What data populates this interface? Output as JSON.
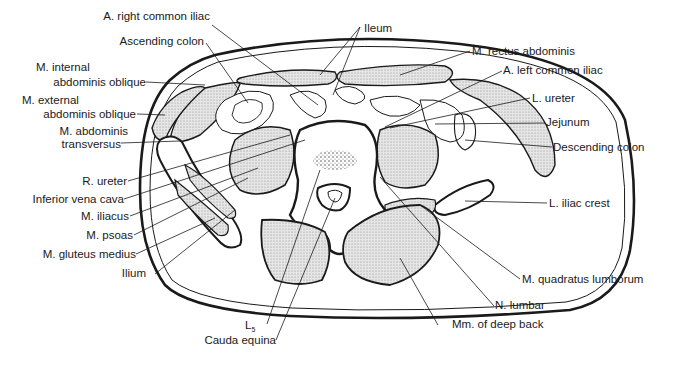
{
  "diagram": {
    "labels": {
      "a_right_common_iliac": "A. right common iliac",
      "ascending_colon": "Ascending colon",
      "m_internal_line1": "M. internal",
      "m_internal_line2": "abdominis oblique",
      "m_external_line1": "M. external",
      "m_external_line2": "abdominis oblique",
      "m_transversus_line1": "M. abdominis",
      "m_transversus_line2": "transversus",
      "r_ureter": "R. ureter",
      "inferior_vena_cava": "Inferior vena cava",
      "m_iliacus": "M. iliacus",
      "m_psoas": "M. psoas",
      "m_gluteus_medius": "M. gluteus medius",
      "ilium": "Ilium",
      "l5": "L",
      "l5_sub": "5",
      "cauda_equina": "Cauda equina",
      "ileum": "Ileum",
      "m_rectus_abdominis": "M. rectus abdominis",
      "a_left_common_iliac": "A. left common iliac",
      "l_ureter": "L. ureter",
      "jejunum": "Jejunum",
      "descending_colon": "Descending colon",
      "l_iliac_crest": "L. iliac crest",
      "m_quadratus_lumborum": "M. quadratus lumborum",
      "n_lumbar": "N. lumbar",
      "mm_deep_back": "Mm. of deep back"
    },
    "colors": {
      "line": "#1a1a1a",
      "muscle_fill": "#d4d4d4",
      "background": "#ffffff"
    }
  }
}
